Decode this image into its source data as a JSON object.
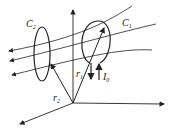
{
  "diagram": {
    "type": "physics-figure",
    "labels": {
      "c1": "C",
      "c1_sub": "1",
      "c2": "C",
      "c2_sub": "2",
      "r1": "r",
      "r1_sub": "1",
      "r2": "r",
      "r2_sub": "2",
      "i0": "I",
      "i0_sub": "0"
    },
    "colors": {
      "stroke": "#222222",
      "background": "#ffffff"
    }
  }
}
